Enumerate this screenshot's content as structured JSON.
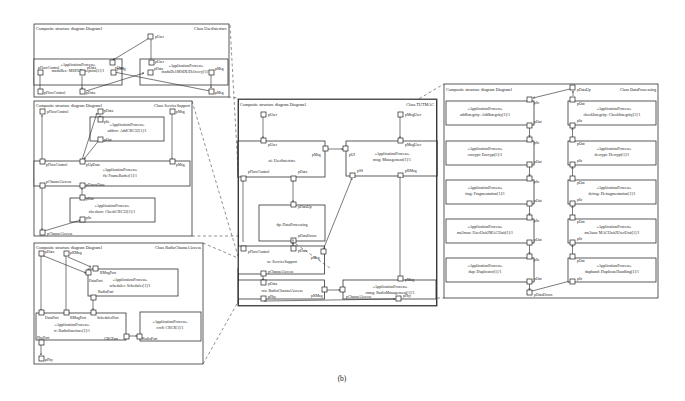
{
  "caption": "(b)",
  "common": {
    "diagram_header": "Composite structure diagram Diagram1",
    "stereotype": "«ApplicationProcess»"
  },
  "user_interface": {
    "class_label": "Class UserInterface",
    "parts": {
      "msdu_rec": "msduRec: MSDUReception[1]/1",
      "msdu_del": "msduDel:MSDUDelivery[1]/1"
    },
    "ports": {
      "pUser": "pUser",
      "pData": "pData",
      "pMsg": "pMsg",
      "pFlowControl": "pFlowControl"
    }
  },
  "service_support": {
    "class_label": "Class ServiceSupport",
    "parts": {
      "addcrc": "addcrc: AddCRC32[1]/1",
      "fb": "fb: FrameBuffer[1]/1",
      "checkcrc": "checkcrc: CheckCRC32[1]/1"
    },
    "ports": {
      "pFlowControl": "pFlowControl",
      "pData": "pData",
      "pMsg": "pMsg",
      "pIn": "pIn",
      "pOut": "pOut",
      "pUpData": "pUpData",
      "pDownData": "pDownData",
      "pChannelAccess": "pChannelAccess"
    }
  },
  "radio_channel_access": {
    "class_label": "Class RadioChannelAccess",
    "parts": {
      "scheduler": "scheduler: Scheduler[1]/1",
      "ri": "ri: RadioInterface[1]/1",
      "crc8": "crc8: CRC8[1]/1"
    },
    "ports": {
      "pData": "pData",
      "pRMng": "pRMng",
      "RMngPort": "RMngPort",
      "DataPort": "DataPort",
      "RadioPort": "RadioPort",
      "SchedulerPort": "SchedulerPort",
      "PhyPort": "PhyPort",
      "CRCPort": "CRCPort",
      "pPhy": "pPhy"
    }
  },
  "tutmac": {
    "class_label": "Class TUTMAC",
    "parts": {
      "ui": "ui: UserInterface",
      "mng": "mng: Management[1]/1",
      "dp": "dp: DataProcessing",
      "ss": "ss: ServiceSupport",
      "rca": "rca: RadioChannelAccess",
      "rmng": "rmng: RadioManagement[1]/1"
    },
    "ports": {
      "pUser": "pUser",
      "pMngUser": "pMngUser",
      "pMsg": "pMsg",
      "pUI": "pUI",
      "pSS": "pSS",
      "pRMng": "pRMng",
      "pFlowControl": "pFlowControl",
      "pData": "pData",
      "pDataUp": "pDataUp",
      "pDataDown": "pDataDown",
      "pChannelAccess": "pChannelAccess",
      "pPhy": "pPhy",
      "pMng": "pMng"
    }
  },
  "data_processing": {
    "class_label": "Class DataProcessing",
    "left_parts": [
      "addIntegrity: AddIntegrity[1]/1",
      "encrypt: Encrypt[1]/1",
      "frag: Fragmentation[1]/1",
      "ms2msu: UserUnit2MACUnit[1]/1",
      "dup: Duplicator[1]/1"
    ],
    "right_parts": [
      "checkIntegrity: CheckIntegrity[1]/1",
      "decrypt: Decrypt[1]/1",
      "defrag: Defragmentation[1]/1",
      "ms2usu: MACUnit2UserUnit[1]/1",
      "duphand: DuplicateHandling[1]/1"
    ],
    "ports": {
      "pDataUp": "pDataUp",
      "pDataDown": "pDataDown",
      "pIn": "pIn",
      "pOut": "pOut"
    }
  }
}
